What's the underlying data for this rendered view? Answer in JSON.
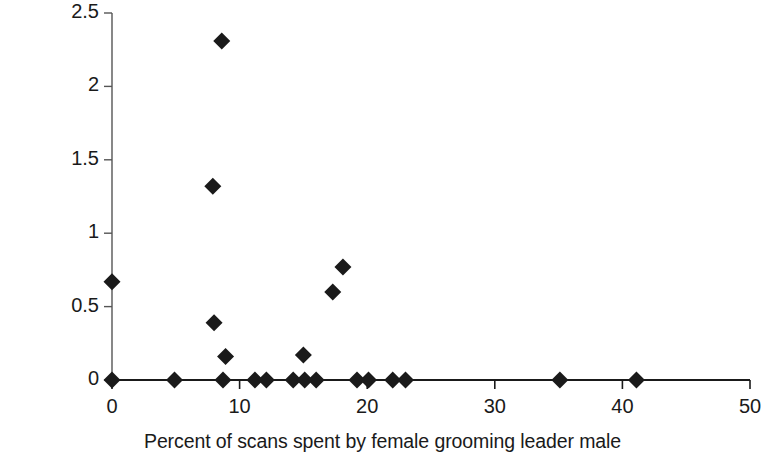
{
  "chart_data": {
    "type": "scatter",
    "title": "",
    "xlabel": "Percent of scans spent by female grooming leader male",
    "ylabel_line1": "Hourly rate of agonism",
    "ylabel_line2": "by leader male towards female",
    "xlim": [
      0,
      50
    ],
    "ylim": [
      0,
      2.5
    ],
    "xticks": [
      0,
      10,
      20,
      30,
      40,
      50
    ],
    "xticklabels": [
      "0",
      "10",
      "20",
      "30",
      "40",
      "50"
    ],
    "yticks": [
      0,
      0.5,
      1,
      1.5,
      2,
      2.5
    ],
    "yticklabels": [
      "0",
      "0.5",
      "1",
      "1.5",
      "2",
      "2.5"
    ],
    "grid": false,
    "legend": null,
    "marker": "diamond",
    "marker_color": "#1a1a1a",
    "points": [
      {
        "x": 0.0,
        "y": 0.67
      },
      {
        "x": 0.0,
        "y": 0.0
      },
      {
        "x": 4.9,
        "y": 0.0
      },
      {
        "x": 8.6,
        "y": 2.31
      },
      {
        "x": 7.9,
        "y": 1.32
      },
      {
        "x": 8.0,
        "y": 0.39
      },
      {
        "x": 8.9,
        "y": 0.16
      },
      {
        "x": 8.7,
        "y": 0.0
      },
      {
        "x": 11.2,
        "y": 0.0
      },
      {
        "x": 12.1,
        "y": 0.0
      },
      {
        "x": 14.2,
        "y": 0.0
      },
      {
        "x": 15.0,
        "y": 0.17
      },
      {
        "x": 15.1,
        "y": 0.0
      },
      {
        "x": 16.0,
        "y": 0.0
      },
      {
        "x": 18.1,
        "y": 0.77
      },
      {
        "x": 17.3,
        "y": 0.6
      },
      {
        "x": 19.2,
        "y": 0.0
      },
      {
        "x": 20.1,
        "y": 0.0
      },
      {
        "x": 22.0,
        "y": 0.0
      },
      {
        "x": 23.0,
        "y": 0.0
      },
      {
        "x": 35.1,
        "y": 0.0
      },
      {
        "x": 41.1,
        "y": 0.0
      }
    ]
  },
  "axes": {
    "x_axis_name": "x-axis",
    "y_axis_name": "y-axis"
  }
}
